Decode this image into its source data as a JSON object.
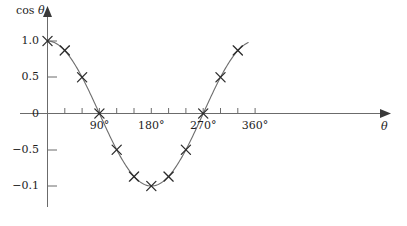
{
  "chart_data": {
    "type": "line",
    "title": "",
    "subtitle": "",
    "xlabel": "θ",
    "ylabel": "cos θ",
    "xlim": [
      0,
      375
    ],
    "ylim": [
      -1.15,
      1.15
    ],
    "grid": false,
    "legend": null,
    "x_tick_labels": [
      {
        "value": 90,
        "text": "90°"
      },
      {
        "value": 180,
        "text": "180°"
      },
      {
        "value": 270,
        "text": "270°"
      },
      {
        "value": 360,
        "text": "360°"
      }
    ],
    "x_tick_values": [
      30,
      60,
      90,
      120,
      150,
      180,
      210,
      240,
      270,
      300,
      330,
      360
    ],
    "y_tick_labels": [
      {
        "value": 1.0,
        "text": "1.0"
      },
      {
        "value": 0.5,
        "text": "0.5"
      },
      {
        "value": 0.0,
        "text": "0"
      },
      {
        "value": -0.5,
        "text": "−0.5"
      },
      {
        "value": -1.0,
        "text": "−0.1"
      }
    ],
    "y_tick_values": [
      1.0,
      0.5,
      0.0,
      -0.5,
      -1.0
    ],
    "marker": "x-cross",
    "series": [
      {
        "name": "cos θ",
        "x": [
          0,
          30,
          60,
          90,
          120,
          150,
          180,
          210,
          240,
          270,
          300,
          330
        ],
        "values": [
          1.0,
          0.87,
          0.5,
          0.0,
          -0.5,
          -0.87,
          -1.0,
          -0.87,
          -0.5,
          0.0,
          0.5,
          0.87
        ]
      }
    ],
    "curve_x_start": 0,
    "curve_x_end": 348,
    "annotations": []
  },
  "colors": {
    "curve": "#6e6e6e",
    "marker": "#2b2b2b",
    "axis": "#6b6b6b",
    "text": "#1d1d1d",
    "background": "#ffffff"
  },
  "axis_titles": {
    "y_prefix": "cos",
    "y_symbol": "θ",
    "x_symbol": "θ"
  }
}
